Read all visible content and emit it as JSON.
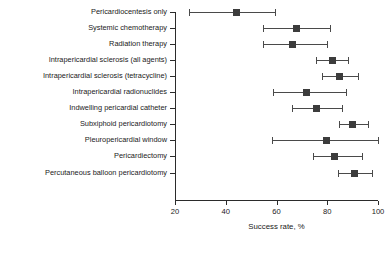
{
  "chart_data": {
    "type": "scatter",
    "title": "",
    "xlabel": "Success rate, %",
    "ylabel": "",
    "xlim": [
      20,
      100
    ],
    "xticks": [
      20,
      40,
      60,
      80,
      100
    ],
    "grid": false,
    "legend": "none",
    "orientation": "horizontal-forest-plot",
    "marker_shape": "square",
    "error_bar_style": "capped-horizontal",
    "categories": [
      "Pericardiocentesis only",
      "Systemic chemotherapy",
      "Radiation therapy",
      "Intrapericardial sclerosis (all agents)",
      "Intrapericardial sclerosis (tetracycline)",
      "Intrapericardial radionuclides",
      "Indwelling pericardial catheter",
      "Subxiphoid pericardiotomy",
      "Pleuropericardial window",
      "Pericardiectomy",
      "Percutaneous balloon pericardiotomy"
    ],
    "values": [
      44.4,
      68.0,
      66.5,
      82.2,
      85.0,
      72.0,
      75.9,
      90.1,
      79.9,
      83.0,
      90.9
    ],
    "ci_low": [
      25.5,
      54.6,
      54.6,
      75.5,
      77.8,
      58.6,
      66.1,
      84.6,
      58.2,
      74.4,
      84.2
    ],
    "ci_high": [
      59.4,
      81.0,
      79.9,
      88.1,
      92.1,
      87.3,
      85.8,
      96.0,
      100.0,
      93.6,
      97.6
    ],
    "colors": {
      "marker": "#3c3c3c",
      "error_bar": "#4a4a4a",
      "axis": "#2b2b2b",
      "text": "#1a1a1a",
      "background": "#ffffff"
    }
  }
}
